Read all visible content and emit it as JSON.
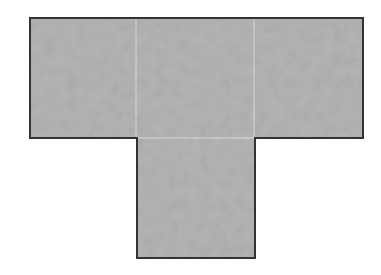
{
  "diagram": {
    "type": "net-of-squares",
    "shape": "T",
    "colors": {
      "background": "#ffffff",
      "fill": "#b4b4b4",
      "fill_light": "#c2c2c2",
      "fill_dark": "#a6a6a6",
      "divider": "#dcdcdc",
      "outline": "#333333"
    },
    "squares": [
      {
        "id": "top-left",
        "x": 30,
        "y": 18,
        "w": 106,
        "h": 120
      },
      {
        "id": "top-center",
        "x": 136,
        "y": 18,
        "w": 118,
        "h": 120
      },
      {
        "id": "top-right",
        "x": 254,
        "y": 18,
        "w": 109,
        "h": 120
      },
      {
        "id": "bottom-stem",
        "x": 137,
        "y": 138,
        "w": 118,
        "h": 120
      }
    ],
    "outline_points": "30,18 363,18 363,138 255,138 255,258 137,258 137,138 30,138"
  }
}
